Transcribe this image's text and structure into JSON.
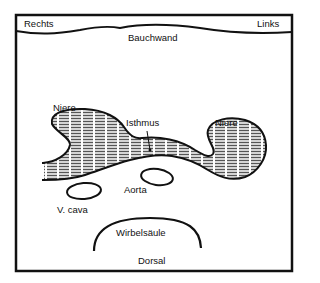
{
  "diagram": {
    "type": "anatomical cross-section (horseshoe kidney)",
    "labels": {
      "right": "Rechts",
      "left": "Links",
      "abdominal_wall": "Bauchwand",
      "kidney_right": "Niere",
      "isthmus": "Isthmus",
      "kidney_left": "Niere",
      "aorta": "Aorta",
      "vena_cava": "V. cava",
      "spine": "Wirbelsäule",
      "dorsal": "Dorsal"
    },
    "colors": {
      "stroke": "#111111",
      "background": "#ffffff",
      "hatch": "#444444"
    }
  }
}
